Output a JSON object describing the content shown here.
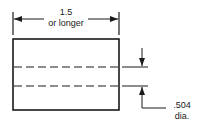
{
  "diagram": {
    "dimension_length": {
      "value": "1.5",
      "qualifier": "or longer"
    },
    "dimension_diameter": {
      "value": ".504",
      "unit_label": "dia."
    },
    "colors": {
      "stroke": "#1a1a1a",
      "background": "#ffffff"
    }
  }
}
